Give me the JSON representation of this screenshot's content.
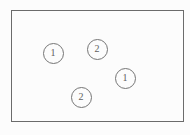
{
  "diagram": {
    "background": "#fcfcfc",
    "box": {
      "x": 11,
      "y": 10,
      "width": 173,
      "height": 112,
      "border_color": "#6b6b6b",
      "border_width": 1.4
    },
    "node_style": {
      "border_color": "#757575",
      "border_width": 1.1,
      "text_color": "#5f5f5f",
      "fill": "#fcfcfc"
    },
    "nodes": [
      {
        "label": "1",
        "cx": 53,
        "cy": 53,
        "r": 10.5
      },
      {
        "label": "2",
        "cx": 97,
        "cy": 49,
        "r": 10.5
      },
      {
        "label": "1",
        "cx": 125,
        "cy": 78,
        "r": 10.5
      },
      {
        "label": "2",
        "cx": 81,
        "cy": 97,
        "r": 10.5
      }
    ]
  }
}
